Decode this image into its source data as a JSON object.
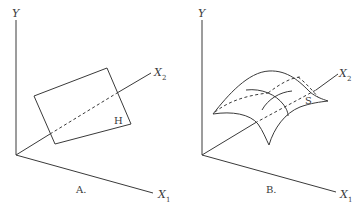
{
  "panels": [
    {
      "id": "A",
      "caption": "A.",
      "axes": {
        "y": "Y",
        "x1": "X",
        "x1_sub": "1",
        "x2": "X",
        "x2_sub": "2"
      },
      "shape": "plane",
      "shape_label": "H"
    },
    {
      "id": "B",
      "caption": "B.",
      "axes": {
        "y": "Y",
        "x1": "X",
        "x1_sub": "1",
        "x2": "X",
        "x2_sub": "2"
      },
      "shape": "curved surface",
      "shape_label": "S"
    }
  ]
}
